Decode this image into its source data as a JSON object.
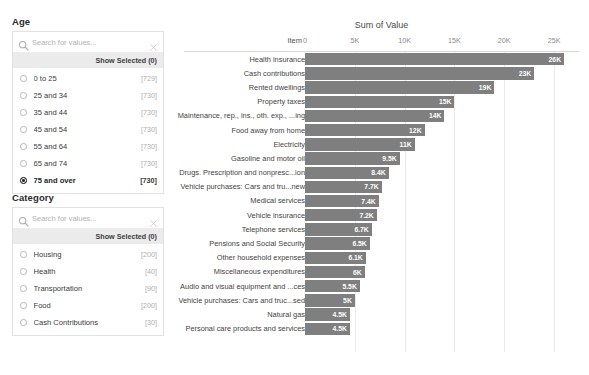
{
  "filters": [
    {
      "id": "age",
      "title": "Age",
      "search_placeholder": "Search for values...",
      "search_value": "",
      "show_selected_label": "Show Selected (0)",
      "items": [
        {
          "label": "0 to 25",
          "count": "[729]",
          "selected": false
        },
        {
          "label": "25 and 34",
          "count": "[730]",
          "selected": false
        },
        {
          "label": "35 and 44",
          "count": "[730]",
          "selected": false
        },
        {
          "label": "45 and 54",
          "count": "[730]",
          "selected": false
        },
        {
          "label": "55 and 64",
          "count": "[730]",
          "selected": false
        },
        {
          "label": "65 and 74",
          "count": "[730]",
          "selected": false
        },
        {
          "label": "75 and over",
          "count": "[730]",
          "selected": true
        }
      ]
    },
    {
      "id": "category",
      "title": "Category",
      "search_placeholder": "Search for values...",
      "search_value": "",
      "show_selected_label": "Show Selected (0)",
      "items": [
        {
          "label": "Housing",
          "count": "[200]",
          "selected": false
        },
        {
          "label": "Health",
          "count": "[40]",
          "selected": false
        },
        {
          "label": "Transportation",
          "count": "[90]",
          "selected": false
        },
        {
          "label": "Food",
          "count": "[200]",
          "selected": false
        },
        {
          "label": "Cash Contributions",
          "count": "[30]",
          "selected": false
        }
      ]
    }
  ],
  "chart_data": {
    "type": "bar",
    "orientation": "horizontal",
    "title": "Sum of Value",
    "xlabel": "",
    "ylabel": "Item",
    "grid": true,
    "legend": null,
    "xlim": [
      0,
      27500
    ],
    "xticks": [
      0,
      5000,
      10000,
      15000,
      20000,
      25000
    ],
    "xtick_labels": [
      "0",
      "5K",
      "10K",
      "15K",
      "20K",
      "25K"
    ],
    "bar_color": "#7f7f7f",
    "categories": [
      "Health insurance",
      "Cash contributions",
      "Rented dwellings",
      "Property taxes",
      "Maintenance, rep., ins., oth. exp., ...ing",
      "Food away from home",
      "Electricity",
      "Gasoline and motor oil",
      "Drugs. Prescription and nonpresc...ion",
      "Vehicle purchases: Cars and tru...new",
      "Medical services",
      "Vehicle insurance",
      "Telephone services",
      "Pensions and Social Security",
      "Other household expenses",
      "Miscellaneous expenditures",
      "Audio and visual equipment and ...ces",
      "Vehicle purchases: Cars and truc...sed",
      "Natural gas",
      "Personal care products and services"
    ],
    "values": [
      26000,
      23000,
      19000,
      15000,
      14000,
      12000,
      11000,
      9500,
      8400,
      7700,
      7400,
      7200,
      6700,
      6500,
      6100,
      6000,
      5500,
      5000,
      4500,
      4500
    ],
    "value_labels": [
      "26K",
      "23K",
      "19K",
      "15K",
      "14K",
      "12K",
      "11K",
      "9.5K",
      "8.4K",
      "7.7K",
      "7.4K",
      "7.2K",
      "6.7K",
      "6.5K",
      "6.1K",
      "6K",
      "5.5K",
      "5K",
      "4.5K",
      "4.5K"
    ]
  }
}
